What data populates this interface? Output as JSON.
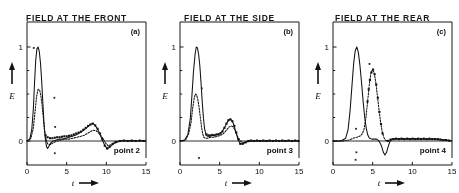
{
  "figure": {
    "background_color": "#ffffff",
    "ink_color": "#141414",
    "panel_count": 3
  },
  "chart_data": [
    {
      "type": "line",
      "title": "FIELD AT THE FRONT",
      "corner_label": "(a)",
      "annotation": "point 2",
      "xlabel": "t",
      "xlabel_arrow": "⟶",
      "ylabel": "E",
      "ylabel_arrow": "↑",
      "xlim": [
        0,
        15
      ],
      "ylim": [
        -0.28,
        1.12
      ],
      "xticks": [
        0,
        5,
        10,
        15
      ],
      "xtick_labels": [
        "0",
        "5",
        "10",
        "15"
      ],
      "yticks": [
        0,
        1
      ],
      "ytick_labels": [
        "0",
        "1"
      ],
      "grid": false,
      "legend": "none",
      "series": [
        {
          "name": "solid-curve",
          "style": "solid",
          "x": [
            0.0,
            0.35,
            0.6,
            0.8,
            0.95,
            1.1,
            1.25,
            1.4,
            1.55,
            1.7,
            1.85,
            2.0,
            2.15,
            2.3,
            2.45,
            2.6,
            2.8,
            3.0,
            3.3,
            3.7,
            4.1,
            4.5,
            4.9,
            5.3,
            5.7,
            6.1,
            6.5,
            6.9,
            7.2,
            7.5,
            7.8,
            8.05,
            8.3,
            8.55,
            8.8,
            9.05,
            9.3,
            9.6,
            9.9,
            10.2,
            10.5,
            10.9,
            11.4,
            11.9,
            12.4,
            12.9,
            13.4,
            13.9,
            14.4,
            15.0
          ],
          "y": [
            0.0,
            0.02,
            0.12,
            0.34,
            0.62,
            0.86,
            0.98,
            1.0,
            0.95,
            0.83,
            0.64,
            0.4,
            0.18,
            0.03,
            -0.06,
            -0.08,
            -0.05,
            -0.02,
            0.0,
            0.01,
            0.02,
            0.02,
            0.03,
            0.04,
            0.05,
            0.06,
            0.08,
            0.1,
            0.12,
            0.14,
            0.16,
            0.18,
            0.185,
            0.17,
            0.14,
            0.1,
            0.05,
            -0.01,
            -0.06,
            -0.08,
            -0.06,
            -0.03,
            -0.01,
            0.0,
            0.005,
            0.0,
            0.005,
            0.0,
            0.005,
            0.0
          ]
        },
        {
          "name": "dotted-curve",
          "style": "dotted",
          "x": [
            0.0,
            0.5,
            0.8,
            1.0,
            1.2,
            1.4,
            1.6,
            1.75,
            1.9,
            2.05,
            2.2,
            2.4,
            2.6,
            2.9,
            3.3,
            3.8,
            4.3,
            4.8,
            5.3,
            5.8,
            6.3,
            6.8,
            7.2,
            7.6,
            8.0,
            8.35,
            8.7,
            9.0,
            9.3,
            9.6,
            9.9,
            10.2,
            10.6,
            11.1,
            11.7,
            12.3,
            12.9,
            13.5,
            14.1,
            14.7,
            15.0
          ],
          "y": [
            0.0,
            0.03,
            0.14,
            0.3,
            0.47,
            0.55,
            0.54,
            0.48,
            0.38,
            0.25,
            0.12,
            0.02,
            -0.03,
            -0.04,
            -0.02,
            0.0,
            0.01,
            0.02,
            0.02,
            0.03,
            0.04,
            0.05,
            0.06,
            0.08,
            0.1,
            0.115,
            0.11,
            0.09,
            0.06,
            0.02,
            -0.02,
            -0.05,
            -0.04,
            -0.01,
            0.0,
            0.0,
            0.0,
            0.0,
            0.0,
            0.0,
            0.0
          ]
        }
      ],
      "markers": [
        {
          "x": 2.35,
          "y": 0.06
        },
        {
          "x": 2.6,
          "y": 0.04
        },
        {
          "x": 2.9,
          "y": 0.03
        },
        {
          "x": 3.2,
          "y": 0.03
        },
        {
          "x": 3.5,
          "y": 0.035
        },
        {
          "x": 3.8,
          "y": 0.04
        },
        {
          "x": 4.1,
          "y": 0.04
        },
        {
          "x": 4.4,
          "y": 0.045
        },
        {
          "x": 4.7,
          "y": 0.05
        },
        {
          "x": 5.0,
          "y": 0.05
        },
        {
          "x": 5.3,
          "y": 0.055
        },
        {
          "x": 5.6,
          "y": 0.06
        },
        {
          "x": 5.9,
          "y": 0.07
        },
        {
          "x": 6.2,
          "y": 0.08
        },
        {
          "x": 6.5,
          "y": 0.09
        },
        {
          "x": 6.8,
          "y": 0.1
        },
        {
          "x": 7.1,
          "y": 0.12
        },
        {
          "x": 7.4,
          "y": 0.14
        },
        {
          "x": 7.7,
          "y": 0.16
        },
        {
          "x": 8.0,
          "y": 0.175
        },
        {
          "x": 8.3,
          "y": 0.185
        },
        {
          "x": 8.6,
          "y": 0.165
        },
        {
          "x": 8.9,
          "y": 0.13
        },
        {
          "x": 9.2,
          "y": 0.08
        },
        {
          "x": 9.5,
          "y": 0.02
        },
        {
          "x": 9.8,
          "y": -0.05
        },
        {
          "x": 10.1,
          "y": -0.08
        },
        {
          "x": 10.4,
          "y": -0.06
        },
        {
          "x": 10.8,
          "y": -0.03
        },
        {
          "x": 11.2,
          "y": -0.01
        },
        {
          "x": 11.7,
          "y": 0.0
        },
        {
          "x": 12.2,
          "y": 0.005
        },
        {
          "x": 12.7,
          "y": 0.0
        },
        {
          "x": 13.2,
          "y": 0.005
        },
        {
          "x": 13.7,
          "y": 0.0
        },
        {
          "x": 14.2,
          "y": 0.005
        },
        {
          "x": 14.7,
          "y": 0.0
        }
      ],
      "noise_dots": [
        {
          "x": 3.45,
          "y": 0.46
        },
        {
          "x": 3.55,
          "y": 0.15
        },
        {
          "x": 3.5,
          "y": -0.13
        },
        {
          "x": 0.85,
          "y": 0.99
        }
      ]
    },
    {
      "type": "line",
      "title": "FIELD AT THE SIDE",
      "corner_label": "(b)",
      "annotation": "point 3",
      "xlabel": "t",
      "xlabel_arrow": "⟶",
      "ylabel": "E",
      "ylabel_arrow": "↑",
      "xlim": [
        0,
        15
      ],
      "ylim": [
        -0.28,
        1.12
      ],
      "xticks": [
        0,
        5,
        10,
        15
      ],
      "xtick_labels": [
        "0",
        "5",
        "10",
        "15"
      ],
      "yticks": [
        0,
        1
      ],
      "ytick_labels": [
        "0",
        "1"
      ],
      "grid": false,
      "legend": "none",
      "series": [
        {
          "name": "solid-curve",
          "style": "solid",
          "x": [
            0.0,
            0.6,
            1.0,
            1.3,
            1.5,
            1.7,
            1.9,
            2.05,
            2.2,
            2.35,
            2.5,
            2.65,
            2.8,
            2.95,
            3.1,
            3.3,
            3.5,
            3.8,
            4.1,
            4.4,
            4.7,
            5.0,
            5.3,
            5.6,
            5.9,
            6.15,
            6.4,
            6.6,
            6.8,
            7.0,
            7.2,
            7.4,
            7.6,
            7.9,
            8.3,
            8.8,
            9.3,
            9.9,
            10.5,
            11.1,
            11.7,
            12.3,
            12.9,
            13.5,
            14.1,
            14.7,
            15.0
          ],
          "y": [
            0.0,
            0.01,
            0.07,
            0.24,
            0.48,
            0.74,
            0.92,
            1.0,
            0.99,
            0.92,
            0.8,
            0.62,
            0.42,
            0.25,
            0.13,
            0.06,
            0.05,
            0.05,
            0.06,
            0.06,
            0.07,
            0.08,
            0.1,
            0.14,
            0.19,
            0.225,
            0.23,
            0.21,
            0.17,
            0.11,
            0.05,
            0.0,
            -0.03,
            -0.03,
            -0.01,
            0.005,
            0.0,
            0.005,
            0.0,
            0.005,
            0.0,
            0.005,
            0.0,
            0.005,
            0.0,
            0.005,
            0.0
          ]
        },
        {
          "name": "dotted-curve",
          "style": "dotted",
          "x": [
            0.0,
            0.7,
            1.1,
            1.4,
            1.6,
            1.8,
            1.95,
            2.1,
            2.25,
            2.4,
            2.55,
            2.7,
            2.85,
            3.0,
            3.2,
            3.5,
            3.9,
            4.3,
            4.7,
            5.1,
            5.5,
            5.9,
            6.2,
            6.45,
            6.7,
            6.9,
            7.1,
            7.3,
            7.6,
            8.0,
            8.5,
            9.0,
            9.6,
            10.2,
            10.9,
            11.6,
            12.3,
            13.0,
            13.7,
            14.4,
            15.0
          ],
          "y": [
            0.0,
            0.01,
            0.08,
            0.2,
            0.35,
            0.46,
            0.5,
            0.49,
            0.44,
            0.36,
            0.26,
            0.16,
            0.08,
            0.04,
            0.03,
            0.03,
            0.04,
            0.04,
            0.05,
            0.06,
            0.08,
            0.12,
            0.15,
            0.16,
            0.15,
            0.12,
            0.08,
            0.04,
            0.0,
            -0.02,
            -0.01,
            0.0,
            0.0,
            0.0,
            0.0,
            0.0,
            0.0,
            0.0,
            0.0,
            0.0,
            0.0
          ]
        }
      ],
      "markers": [
        {
          "x": 3.35,
          "y": 0.07
        },
        {
          "x": 3.6,
          "y": 0.06
        },
        {
          "x": 3.85,
          "y": 0.06
        },
        {
          "x": 4.1,
          "y": 0.065
        },
        {
          "x": 4.35,
          "y": 0.06
        },
        {
          "x": 4.6,
          "y": 0.07
        },
        {
          "x": 4.85,
          "y": 0.07
        },
        {
          "x": 5.1,
          "y": 0.08
        },
        {
          "x": 5.35,
          "y": 0.1
        },
        {
          "x": 5.6,
          "y": 0.14
        },
        {
          "x": 5.85,
          "y": 0.185
        },
        {
          "x": 6.1,
          "y": 0.22
        },
        {
          "x": 6.35,
          "y": 0.23
        },
        {
          "x": 6.6,
          "y": 0.21
        },
        {
          "x": 6.85,
          "y": 0.16
        },
        {
          "x": 7.1,
          "y": 0.09
        },
        {
          "x": 7.35,
          "y": 0.02
        },
        {
          "x": 7.6,
          "y": -0.03
        },
        {
          "x": 7.9,
          "y": -0.03
        },
        {
          "x": 8.25,
          "y": -0.015
        },
        {
          "x": 8.6,
          "y": 0.0
        },
        {
          "x": 8.95,
          "y": 0.005
        },
        {
          "x": 9.3,
          "y": 0.0
        },
        {
          "x": 9.7,
          "y": 0.005
        },
        {
          "x": 10.1,
          "y": 0.0
        },
        {
          "x": 10.5,
          "y": 0.005
        },
        {
          "x": 10.9,
          "y": 0.0
        },
        {
          "x": 11.3,
          "y": 0.005
        },
        {
          "x": 11.7,
          "y": 0.0
        },
        {
          "x": 12.1,
          "y": 0.005
        },
        {
          "x": 12.5,
          "y": 0.0
        },
        {
          "x": 12.9,
          "y": 0.005
        },
        {
          "x": 13.3,
          "y": 0.0
        },
        {
          "x": 13.7,
          "y": 0.005
        },
        {
          "x": 14.1,
          "y": 0.0
        },
        {
          "x": 14.5,
          "y": 0.005
        },
        {
          "x": 14.9,
          "y": 0.0
        }
      ],
      "noise_dots": [
        {
          "x": 2.75,
          "y": 0.56
        },
        {
          "x": 2.4,
          "y": -0.18
        }
      ]
    },
    {
      "type": "line",
      "title": "FIELD AT THE REAR",
      "corner_label": "(c)",
      "annotation": "point 4",
      "xlabel": "t",
      "xlabel_arrow": "⟶",
      "ylabel": "E",
      "ylabel_arrow": "↑",
      "xlim": [
        0,
        15
      ],
      "ylim": [
        -0.28,
        1.12
      ],
      "xticks": [
        0,
        5,
        10,
        15
      ],
      "xtick_labels": [
        "0",
        "5",
        "10",
        "15"
      ],
      "yticks": [
        0,
        1
      ],
      "ytick_labels": [
        "0",
        "1"
      ],
      "grid": false,
      "legend": "none",
      "series": [
        {
          "name": "solid-curve",
          "style": "solid",
          "x": [
            0.0,
            1.0,
            1.6,
            1.9,
            2.15,
            2.4,
            2.6,
            2.8,
            3.0,
            3.2,
            3.4,
            3.6,
            3.8,
            4.0,
            4.2,
            4.4,
            4.6,
            4.9,
            5.2,
            5.5,
            5.8,
            6.1,
            6.35,
            6.55,
            6.75,
            6.95,
            7.2,
            7.5,
            7.9,
            8.4,
            8.9,
            9.5,
            10.1,
            10.7,
            11.3,
            11.9,
            12.5,
            13.1,
            13.7,
            14.3,
            15.0
          ],
          "y": [
            0.0,
            0.0,
            0.03,
            0.12,
            0.32,
            0.6,
            0.82,
            0.96,
            1.0,
            0.94,
            0.8,
            0.62,
            0.42,
            0.25,
            0.13,
            0.06,
            0.03,
            0.02,
            0.02,
            0.02,
            0.0,
            -0.05,
            -0.12,
            -0.15,
            -0.12,
            -0.06,
            0.0,
            0.02,
            0.025,
            0.02,
            0.025,
            0.02,
            0.025,
            0.02,
            0.025,
            0.02,
            0.025,
            0.02,
            0.015,
            0.01,
            0.0
          ]
        },
        {
          "name": "dotted-curve",
          "style": "dotted",
          "x": [
            0.0,
            1.2,
            2.0,
            2.6,
            3.0,
            3.35,
            3.65,
            3.9,
            4.15,
            4.4,
            4.6,
            4.8,
            5.0,
            5.2,
            5.4,
            5.6,
            5.8,
            6.0,
            6.2,
            6.4,
            6.6,
            6.85,
            7.1,
            7.4,
            7.8,
            8.3,
            8.9,
            9.5,
            10.2,
            10.9,
            11.6,
            12.3,
            13.0,
            13.7,
            14.4,
            15.0
          ],
          "y": [
            0.0,
            0.0,
            0.01,
            0.03,
            0.04,
            0.05,
            0.07,
            0.12,
            0.25,
            0.45,
            0.62,
            0.73,
            0.76,
            0.72,
            0.62,
            0.48,
            0.33,
            0.2,
            0.1,
            0.04,
            0.01,
            0.0,
            0.01,
            0.02,
            0.02,
            0.025,
            0.02,
            0.025,
            0.02,
            0.025,
            0.02,
            0.02,
            0.015,
            0.01,
            0.005,
            0.0
          ]
        }
      ],
      "markers": [
        {
          "x": 4.35,
          "y": 0.42
        },
        {
          "x": 4.5,
          "y": 0.55
        },
        {
          "x": 4.65,
          "y": 0.65
        },
        {
          "x": 4.85,
          "y": 0.73
        },
        {
          "x": 5.05,
          "y": 0.76
        },
        {
          "x": 5.25,
          "y": 0.71
        },
        {
          "x": 5.45,
          "y": 0.6
        },
        {
          "x": 5.65,
          "y": 0.46
        },
        {
          "x": 5.85,
          "y": 0.31
        },
        {
          "x": 6.05,
          "y": 0.18
        },
        {
          "x": 6.25,
          "y": 0.08
        },
        {
          "x": 6.9,
          "y": 0.0
        },
        {
          "x": 7.25,
          "y": 0.015
        },
        {
          "x": 7.6,
          "y": 0.02
        },
        {
          "x": 7.95,
          "y": 0.025
        },
        {
          "x": 8.3,
          "y": 0.02
        },
        {
          "x": 8.65,
          "y": 0.025
        },
        {
          "x": 9.0,
          "y": 0.02
        },
        {
          "x": 9.35,
          "y": 0.025
        },
        {
          "x": 9.7,
          "y": 0.02
        },
        {
          "x": 10.05,
          "y": 0.025
        },
        {
          "x": 10.4,
          "y": 0.02
        },
        {
          "x": 10.75,
          "y": 0.025
        },
        {
          "x": 11.1,
          "y": 0.02
        },
        {
          "x": 11.45,
          "y": 0.025
        },
        {
          "x": 11.8,
          "y": 0.02
        },
        {
          "x": 12.15,
          "y": 0.025
        },
        {
          "x": 12.5,
          "y": 0.02
        },
        {
          "x": 12.85,
          "y": 0.02
        },
        {
          "x": 13.2,
          "y": 0.02
        },
        {
          "x": 13.55,
          "y": 0.015
        },
        {
          "x": 13.9,
          "y": 0.01
        },
        {
          "x": 14.25,
          "y": 0.01
        },
        {
          "x": 14.6,
          "y": 0.005
        }
      ],
      "noise_dots": [
        {
          "x": 4.6,
          "y": 0.82
        },
        {
          "x": 2.9,
          "y": 0.13
        },
        {
          "x": 2.95,
          "y": -0.12
        },
        {
          "x": 2.85,
          "y": -0.2
        }
      ]
    }
  ]
}
